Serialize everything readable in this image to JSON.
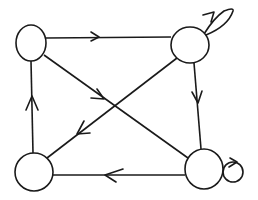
{
  "diagram": {
    "type": "directed-graph",
    "stroke_color": "#1a1a1a",
    "background": "#ffffff",
    "nodes": [
      {
        "id": "top-left",
        "cx": 31,
        "cy": 43,
        "rx": 15,
        "ry": 18
      },
      {
        "id": "top-right",
        "cx": 190,
        "cy": 45,
        "rx": 19,
        "ry": 18
      },
      {
        "id": "bottom-left",
        "cx": 34,
        "cy": 172,
        "rx": 19,
        "ry": 19
      },
      {
        "id": "bottom-right",
        "cx": 204,
        "cy": 169,
        "rx": 19,
        "ry": 20
      }
    ],
    "edges": [
      {
        "from": "top-left",
        "to": "top-right",
        "label": ""
      },
      {
        "from": "top-left",
        "to": "bottom-right",
        "label": ""
      },
      {
        "from": "top-right",
        "to": "bottom-right",
        "label": ""
      },
      {
        "from": "top-right",
        "to": "bottom-left",
        "label": ""
      },
      {
        "from": "bottom-right",
        "to": "bottom-left",
        "label": ""
      },
      {
        "from": "bottom-left",
        "to": "top-left",
        "label": ""
      },
      {
        "from": "top-right",
        "to": "top-right",
        "label": "",
        "style": "petal-loop"
      },
      {
        "from": "bottom-right",
        "to": "bottom-right",
        "label": "",
        "style": "circle-loop"
      }
    ]
  }
}
